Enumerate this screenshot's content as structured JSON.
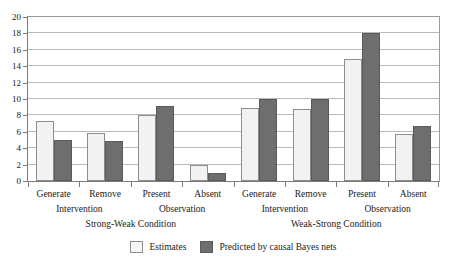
{
  "chart_data": {
    "type": "bar",
    "title": "",
    "xlabel": "",
    "ylabel": "",
    "ylim": [
      0,
      20
    ],
    "ytick_values": [
      20,
      18,
      16,
      14,
      12,
      10,
      8,
      6,
      4,
      2,
      0
    ],
    "grid": true,
    "legend_position": "bottom-center",
    "categories": [
      "Generate",
      "Remove",
      "Present",
      "Absent",
      "Generate",
      "Remove",
      "Present",
      "Absent"
    ],
    "category_group_labels": [
      "Intervention",
      "Observation",
      "Intervention",
      "Observation"
    ],
    "condition_labels": [
      "Strong-Weak Condition",
      "Weak-Strong Condition"
    ],
    "series": [
      {
        "name": "Estimates",
        "color": "#f2f2f2",
        "values": [
          7.3,
          5.9,
          8.0,
          2.0,
          8.9,
          8.8,
          14.9,
          5.7
        ]
      },
      {
        "name": "Predicted by causal Bayes nets",
        "color": "#6e6e6e",
        "values": [
          5.0,
          4.9,
          9.2,
          1.0,
          10.0,
          10.0,
          18.0,
          6.7
        ]
      }
    ]
  },
  "legend": {
    "items": [
      {
        "label": "Estimates",
        "swatch": "light-swatch-icon"
      },
      {
        "label": "Predicted by causal Bayes nets",
        "swatch": "dark-swatch-icon"
      }
    ]
  }
}
